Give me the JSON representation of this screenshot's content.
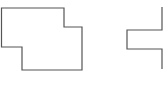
{
  "diagram": {
    "width": 165,
    "height": 89,
    "stroke_color": "#555555",
    "stroke_width": 1.2,
    "shapes": [
      {
        "name": "left-polygon",
        "points": "1.5,8 64,8 64,27 82,27 82,70 22,70 22,47 1.5,47"
      },
      {
        "name": "right-polyline",
        "points": "162,7 162,30 127,30 127,49 162,49 162,69"
      }
    ]
  }
}
